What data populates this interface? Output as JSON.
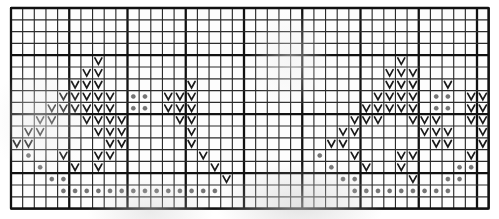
{
  "chart_data": {
    "type": "heatmap",
    "title": "",
    "subtitle": "",
    "xlabel": "",
    "ylabel": "",
    "columns": 41,
    "rows": 17,
    "xlim": [
      0,
      41
    ],
    "ylim": [
      0,
      17
    ],
    "grid": true,
    "legend_position": "none",
    "categories": [
      "empty",
      "v-stitch",
      "dot"
    ],
    "symbols": {
      "empty": "",
      "v": "v-stitch",
      "d": "purl-dot"
    },
    "major_gridline_interval_x": 5,
    "major_gridline_interval_y": 5,
    "major_gridline_columns": [
      0,
      5,
      10,
      15,
      20,
      25,
      30,
      35,
      40,
      41
    ],
    "major_gridline_rows": [
      0,
      4,
      9,
      14,
      17
    ],
    "cells": [
      ".........................................",
      ".........................................",
      ".........................................",
      ".........................................",
      ".......v.........................v.......",
      "......vv........................vvv......",
      ".....vvv.......v................vvv..v...",
      "....vvvvv.dd.vvv...............vvvv.dd.vv",
      "...vvvvvv.dd.vvv..............vvvvv.dd.vv",
      "..vv..vvvv....vv.............vvv..vvv..vv",
      ".vv....vvv.....v............vv.....vvv..v",
      "vv......vv.....v...........vv.......vv..v",
      ".d..v..vv.......v.........d..v...vv....v.",
      "..d..v.v.........v.........d..v..v....dd.",
      "...dd.............v.........dd....v..dd..",
      "....dddddddddddddd...........ddddddddd...",
      "........................................."
    ],
    "v_stitch_positions": [
      {
        "row": 4,
        "cols": [
          7,
          33
        ]
      },
      {
        "row": 5,
        "cols": [
          6,
          7,
          32,
          33,
          34
        ]
      },
      {
        "row": 6,
        "cols": [
          5,
          6,
          7,
          15,
          32,
          33,
          34,
          37
        ]
      },
      {
        "row": 7,
        "cols": [
          4,
          5,
          6,
          7,
          8,
          13,
          14,
          15,
          31,
          32,
          33,
          34,
          39,
          40
        ]
      },
      {
        "row": 8,
        "cols": [
          3,
          4,
          5,
          6,
          7,
          8,
          13,
          14,
          15,
          30,
          31,
          32,
          33,
          34,
          39,
          40
        ]
      },
      {
        "row": 9,
        "cols": [
          2,
          3,
          6,
          7,
          8,
          9,
          14,
          15,
          29,
          30,
          31,
          34,
          35,
          36,
          39,
          40
        ]
      },
      {
        "row": 10,
        "cols": [
          1,
          2,
          7,
          8,
          9,
          15,
          28,
          29,
          35,
          36,
          37,
          40
        ]
      },
      {
        "row": 11,
        "cols": [
          0,
          1,
          8,
          9,
          15,
          27,
          28,
          36,
          37,
          40
        ]
      },
      {
        "row": 12,
        "cols": [
          4,
          7,
          8,
          16,
          29,
          33,
          34,
          39
        ]
      },
      {
        "row": 13,
        "cols": [
          5,
          7,
          17,
          30,
          33
        ]
      },
      {
        "row": 14,
        "cols": [
          18,
          34
        ]
      }
    ],
    "dot_positions": [
      {
        "row": 7,
        "cols": [
          10,
          11,
          36,
          37
        ]
      },
      {
        "row": 8,
        "cols": [
          10,
          11,
          36,
          37
        ]
      },
      {
        "row": 12,
        "cols": [
          1,
          26
        ]
      },
      {
        "row": 13,
        "cols": [
          2,
          27,
          38,
          39
        ]
      },
      {
        "row": 14,
        "cols": [
          3,
          4,
          28,
          29,
          37,
          38
        ]
      },
      {
        "row": 15,
        "cols": [
          4,
          5,
          6,
          7,
          8,
          9,
          10,
          11,
          12,
          13,
          14,
          15,
          16,
          17,
          29,
          30,
          31,
          32,
          33,
          34,
          35,
          36,
          37
        ]
      }
    ],
    "geometry": {
      "origin_x": 11,
      "origin_y": 8,
      "cell_width": 11.65,
      "cell_height": 11.8
    }
  }
}
